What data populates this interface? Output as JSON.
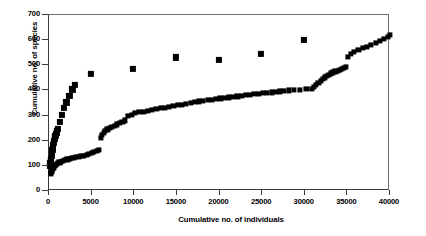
{
  "chart_data": {
    "type": "scatter",
    "title": "",
    "xlabel": "Cumulative no. of individuals",
    "ylabel": "Cumulative no. of species",
    "xlim": [
      0,
      40000
    ],
    "ylim": [
      0,
      700
    ],
    "xticks": [
      0,
      5000,
      10000,
      15000,
      20000,
      25000,
      30000,
      35000,
      40000
    ],
    "yticks": [
      0,
      100,
      200,
      300,
      400,
      500,
      600,
      700
    ],
    "xtick_labels": [
      "0",
      "5000",
      "10000",
      "15000",
      "20000",
      "25000",
      "30000",
      "35000",
      "40000"
    ],
    "ytick_labels": [
      "0",
      "100",
      "200",
      "300",
      "400",
      "500",
      "600",
      "700"
    ],
    "grid": false,
    "legend": "none",
    "marker": "square",
    "marker_color": "#000000",
    "series": [
      {
        "name": "Steep accumulation series",
        "marker_size": 3.1,
        "x": [
          100,
          160,
          200,
          250,
          300,
          350,
          400,
          450,
          500,
          550,
          600,
          650,
          700,
          760,
          820,
          880,
          950,
          1050,
          1250,
          1500,
          1750,
          2050,
          2400,
          2750,
          3050,
          4950,
          9800,
          14900,
          19900,
          24900,
          29900
        ],
        "y": [
          100,
          110,
          118,
          128,
          140,
          150,
          162,
          172,
          183,
          192,
          200,
          207,
          214,
          220,
          226,
          232,
          238,
          247,
          275,
          302,
          330,
          352,
          378,
          404,
          423,
          466,
          486,
          531,
          521,
          546,
          600
        ]
      },
      {
        "name": "Shallow accumulation series",
        "marker_size": 2.6,
        "x": [
          190,
          280,
          360,
          450,
          540,
          640,
          760,
          900,
          1050,
          1220,
          1420,
          1650,
          1900,
          2150,
          2400,
          2650,
          2900,
          3200,
          3500,
          3800,
          4100,
          4400,
          4700,
          5000,
          5300,
          5600,
          5850,
          6050,
          6200,
          6400,
          6600,
          6850,
          7100,
          7400,
          7700,
          8000,
          8300,
          8600,
          8900,
          9300,
          9700,
          10100,
          10600,
          11100,
          11600,
          12100,
          12600,
          13100,
          13600,
          14100,
          14600,
          15100,
          15600,
          16100,
          16600,
          17100,
          17600,
          18100,
          18600,
          19100,
          19600,
          20100,
          20600,
          21100,
          21600,
          22100,
          22600,
          23100,
          23600,
          24100,
          24600,
          25100,
          25600,
          26100,
          26600,
          27100,
          27600,
          28100,
          28700,
          29400,
          30200,
          30800,
          31100,
          31350,
          31600,
          31850,
          32100,
          32350,
          32600,
          32850,
          33100,
          33350,
          33600,
          33850,
          34100,
          34350,
          34600,
          34850,
          35100,
          35400,
          35800,
          36300,
          36800,
          37300,
          37800,
          38300,
          38800,
          39300,
          39800,
          40000
        ],
        "y": [
          70,
          76,
          82,
          88,
          94,
          100,
          104,
          108,
          111,
          114,
          117,
          120,
          123,
          126,
          128,
          131,
          133,
          135,
          137,
          139,
          141,
          143,
          146,
          150,
          155,
          160,
          165,
          212,
          222,
          230,
          238,
          245,
          250,
          255,
          260,
          265,
          270,
          276,
          281,
          299,
          304,
          309,
          313,
          316,
          320,
          323,
          326,
          329,
          332,
          336,
          340,
          342,
          344,
          347,
          350,
          353,
          356,
          359,
          361,
          363,
          366,
          368,
          370,
          372,
          374,
          376,
          379,
          381,
          383,
          385,
          387,
          389,
          390,
          392,
          394,
          396,
          398,
          400,
          401,
          403,
          405,
          407,
          414,
          422,
          430,
          438,
          446,
          452,
          458,
          463,
          468,
          472,
          476,
          479,
          483,
          487,
          491,
          495,
          534,
          544,
          552,
          560,
          568,
          574,
          582,
          590,
          598,
          606,
          614,
          622
        ]
      }
    ]
  }
}
